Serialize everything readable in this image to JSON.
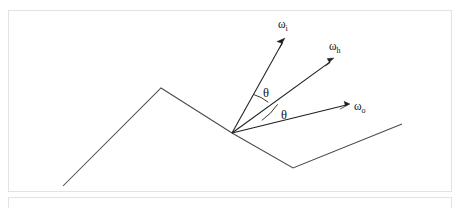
{
  "figure": {
    "canvas": {
      "width": 461,
      "height": 208
    },
    "background_color": "#ffffff",
    "line_color": "#4a4a4a",
    "vector_color": "#1f1f1f",
    "frame_color": "#e3e3e3",
    "text_color": "#111111"
  },
  "frames": [
    {
      "name": "main-frame",
      "x": 8,
      "y": 10,
      "width": 444,
      "height": 182
    },
    {
      "name": "lower-frame",
      "x": 8,
      "y": 197,
      "width": 444,
      "height": 30
    }
  ],
  "surface": {
    "name": "rough-surface-profile",
    "points": [
      {
        "x": 63,
        "y": 186
      },
      {
        "x": 161,
        "y": 88
      },
      {
        "x": 232,
        "y": 133
      },
      {
        "x": 293,
        "y": 168
      },
      {
        "x": 402,
        "y": 124
      }
    ],
    "origin_point": {
      "x": 232,
      "y": 133
    }
  },
  "vectors": [
    {
      "name": "omega-i",
      "label": "ω",
      "subscript": "i",
      "from": {
        "x": 232,
        "y": 133
      },
      "to": {
        "x": 285,
        "y": 38
      },
      "label_pos": {
        "x": 281,
        "y": 26
      }
    },
    {
      "name": "omega-h",
      "label": "ω",
      "subscript": "h",
      "from": {
        "x": 232,
        "y": 133
      },
      "to": {
        "x": 334,
        "y": 58
      },
      "label_pos": {
        "x": 332,
        "y": 48
      }
    },
    {
      "name": "omega-o",
      "label": "ω",
      "subscript": "o",
      "from": {
        "x": 232,
        "y": 133
      },
      "to": {
        "x": 350,
        "y": 104
      },
      "label_pos": {
        "x": 355,
        "y": 108
      }
    }
  ],
  "angles": [
    {
      "name": "theta-upper",
      "label": "θ",
      "between": [
        "omega-i",
        "omega-h"
      ],
      "radius": 44,
      "label_pos": {
        "x": 264,
        "y": 95
      }
    },
    {
      "name": "theta-lower",
      "label": "θ",
      "between": [
        "omega-h",
        "omega-o"
      ],
      "radius": 62,
      "label_pos": {
        "x": 284,
        "y": 116
      }
    }
  ]
}
